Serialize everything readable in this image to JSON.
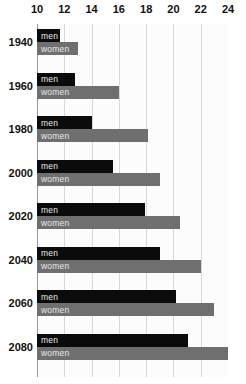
{
  "chart_data": {
    "type": "bar",
    "orientation": "horizontal",
    "title": "",
    "subtitle": "",
    "xlabel": "",
    "ylabel": "",
    "xlim": [
      10,
      24
    ],
    "x_ticks": [
      10,
      12,
      14,
      16,
      18,
      20,
      22,
      24
    ],
    "x_tick_labels": [
      "10",
      "12",
      "14",
      "16",
      "18",
      "20",
      "22",
      "24"
    ],
    "axis_position": "top",
    "grid": true,
    "grid_axis": "x",
    "legend": "inline-bar-labels",
    "categories": [
      "1940",
      "1960",
      "1980",
      "2000",
      "2020",
      "2040",
      "2060",
      "2080"
    ],
    "series": [
      {
        "name": "men",
        "color": "#0b0b0b",
        "values": [
          11.7,
          12.8,
          14.0,
          15.6,
          17.9,
          19.0,
          20.2,
          21.1
        ]
      },
      {
        "name": "women",
        "color": "#6f6f6f",
        "values": [
          13.0,
          16.0,
          18.1,
          19.0,
          20.5,
          22.0,
          23.0,
          24.0
        ]
      }
    ]
  },
  "colors": {
    "men_bar": "#0b0b0b",
    "women_bar": "#6f6f6f",
    "gridline": "#d8d8d8",
    "axis_line": "#9a9a9a",
    "plot_background": "#fcfcfc",
    "page_background": "#ffffff",
    "tick_text": "#111111",
    "bar_label_text": "#e9e9e9"
  }
}
